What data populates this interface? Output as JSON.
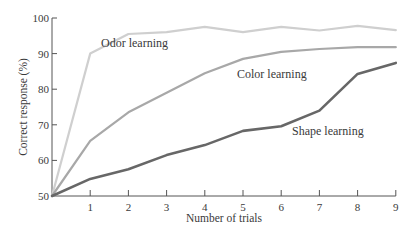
{
  "chart_data": {
    "type": "line",
    "title": "",
    "xlabel": "Number of trials",
    "ylabel": "Correct response (%)",
    "x": [
      0,
      1,
      2,
      3,
      4,
      5,
      6,
      7,
      8,
      9
    ],
    "xticks": [
      "1",
      "2",
      "3",
      "4",
      "5",
      "6",
      "7",
      "8",
      "9"
    ],
    "yticks": [
      "50",
      "60",
      "70",
      "80",
      "90",
      "100"
    ],
    "xlim": [
      0,
      9
    ],
    "ylim": [
      50,
      100
    ],
    "grid": false,
    "legend": "inline labels",
    "series": [
      {
        "name": "Odor learning",
        "color": "#cfcfcf",
        "values": [
          50,
          90,
          95.5,
          96,
          97.5,
          96,
          97.5,
          96.5,
          97.8,
          96.6
        ],
        "label_pos": [
          101,
          47
        ]
      },
      {
        "name": "Color learning",
        "color": "#a8a8a8",
        "values": [
          50,
          65.5,
          73.5,
          79,
          84.5,
          88.5,
          90.5,
          91.3,
          91.8,
          91.8
        ],
        "label_pos": [
          237,
          78
        ]
      },
      {
        "name": "Shape learning",
        "color": "#676767",
        "values": [
          50,
          54.8,
          57.5,
          61.5,
          64.3,
          68.3,
          69.6,
          74,
          84.3,
          87.4
        ],
        "label_pos": [
          292,
          135
        ]
      }
    ]
  }
}
